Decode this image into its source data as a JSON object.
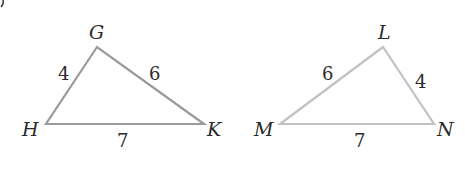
{
  "figure": {
    "triangle_1": {
      "vertices": {
        "top": "G",
        "left": "H",
        "right": "K"
      },
      "sides": {
        "GH": "4",
        "GK": "6",
        "HK": "7"
      },
      "stroke_color": "#9a9a9a"
    },
    "triangle_2": {
      "vertices": {
        "top": "L",
        "left": "M",
        "right": "N"
      },
      "sides": {
        "LM": "6",
        "LN": "4",
        "MN": "7"
      },
      "stroke_color": "#c2c2c2"
    }
  }
}
